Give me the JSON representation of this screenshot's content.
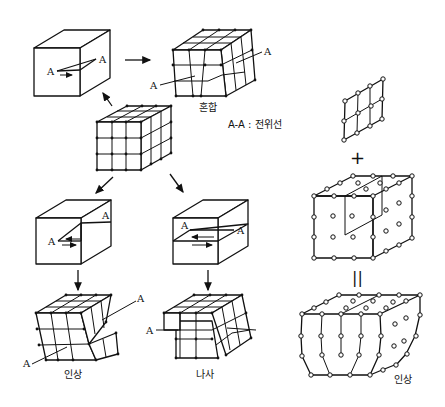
{
  "figure": {
    "labels": {
      "point_a": "A",
      "mixed": "혼합",
      "legend": "A-A : 전위선",
      "edge": "인상",
      "screw": "나사",
      "edge_right": "인상"
    },
    "symbols": {
      "plus": "+",
      "equals": "||"
    },
    "panels": [
      {
        "id": "perfect-lattice",
        "description": "3x3x3 cubic lattice (center)"
      },
      {
        "id": "mixed-slip-block",
        "description": "Block with slip plane, A-A dislocation line, mixed"
      },
      {
        "id": "mixed-lattice",
        "description": "Lattice with mixed dislocation",
        "caption": "혼합"
      },
      {
        "id": "edge-slip-block",
        "description": "Block with slip plane (edge)"
      },
      {
        "id": "edge-lattice",
        "description": "Lattice with edge dislocation",
        "caption": "인상"
      },
      {
        "id": "screw-slip-block",
        "description": "Block with slip plane (screw)"
      },
      {
        "id": "screw-lattice",
        "description": "Lattice with screw dislocation",
        "caption": "나사"
      },
      {
        "id": "extra-half-plane",
        "description": "Extra half plane of atoms"
      },
      {
        "id": "atom-cube",
        "description": "Atom cube with inserted half-plane"
      },
      {
        "id": "edge-result",
        "description": "Resulting edge dislocation",
        "caption": "인상"
      }
    ],
    "colors": {
      "line": "#111111",
      "background": "#ffffff"
    }
  }
}
